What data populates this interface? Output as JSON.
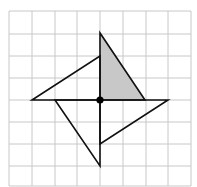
{
  "diagram": {
    "type": "pinwheel rotation on grid",
    "grid": {
      "columns": 8,
      "rows": 8,
      "line_color": "#c8c8c8"
    },
    "center_point": {
      "x": 0,
      "y": 0,
      "color": "#000000"
    },
    "shapes": [
      {
        "name": "shaded-triangle",
        "points": [
          [
            0,
            0
          ],
          [
            0,
            3
          ],
          [
            2,
            0
          ]
        ],
        "fill": "#c8c8c8"
      },
      {
        "name": "left-triangle",
        "points": [
          [
            0,
            0
          ],
          [
            0,
            2
          ],
          [
            -3,
            0
          ]
        ],
        "fill": "none"
      },
      {
        "name": "bottom-triangle",
        "points": [
          [
            0,
            0
          ],
          [
            -2,
            0
          ],
          [
            0,
            -3
          ]
        ],
        "fill": "none"
      },
      {
        "name": "right-triangle",
        "points": [
          [
            0,
            0
          ],
          [
            0,
            -2
          ],
          [
            3,
            0
          ]
        ],
        "fill": "none"
      }
    ]
  }
}
